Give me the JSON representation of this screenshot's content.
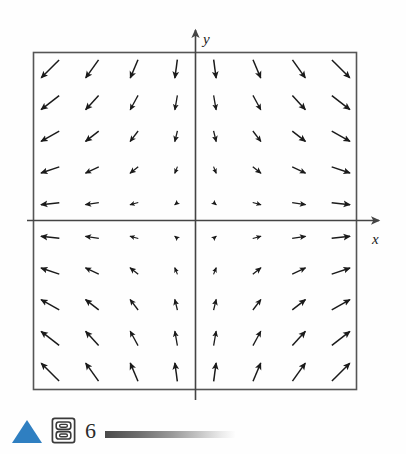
{
  "figure": {
    "caption_number": "6",
    "axis_x_label": "x",
    "axis_y_label": "y",
    "frame_color": "#555555",
    "axis_color": "#444444",
    "arrow_color": "#1a1a1a",
    "accent_color": "#2f7fc1"
  },
  "caption": {
    "triangle_icon": "play-triangle-icon",
    "module_icon": "stacked-panels-icon",
    "number": "6",
    "rule": "gradient-rule"
  },
  "chart_data": {
    "type": "scatter",
    "subtype": "vector-field",
    "title": "",
    "xlabel": "x",
    "ylabel": "y",
    "xlim": [
      -5,
      5
    ],
    "ylim": [
      -5,
      5
    ],
    "grid": false,
    "legend": null,
    "field_expression": "F(x, y) = (x, -y)",
    "field_u": "x",
    "field_v": "-y",
    "sample_x": [
      -4.5,
      -3.2,
      -1.9,
      -0.6,
      0.6,
      1.9,
      3.2,
      4.5
    ],
    "sample_y": [
      4.5,
      3.5,
      2.5,
      1.5,
      0.5,
      -0.5,
      -1.5,
      -2.5,
      -3.5,
      -4.5
    ],
    "arrow_scale": 4.6,
    "axes_arrowheads": true,
    "frame": {
      "left": -5,
      "right": 5,
      "bottom": -5,
      "top": 5
    }
  }
}
